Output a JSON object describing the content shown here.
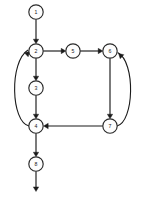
{
  "diagram": {
    "type": "directed-graph",
    "canvas": {
      "width": 145,
      "height": 200,
      "background": "#ffffff"
    },
    "style": {
      "node_fill": "#fdfdfd",
      "node_stroke": "#2a2a2a",
      "edge_color": "#1a1a1a",
      "label_color": "#202020",
      "node_radius": 7.2
    },
    "nodes": [
      {
        "id": "n1",
        "label": "1",
        "cx": 36,
        "cy": 12,
        "r": 7.2
      },
      {
        "id": "n2",
        "label": "2",
        "cx": 36,
        "cy": 51,
        "r": 7.2
      },
      {
        "id": "n3",
        "label": "3",
        "cx": 36,
        "cy": 88,
        "r": 7.2
      },
      {
        "id": "n4",
        "label": "4",
        "cx": 36,
        "cy": 126,
        "r": 7.2
      },
      {
        "id": "n5",
        "label": "5",
        "cx": 73,
        "cy": 51,
        "r": 7.2
      },
      {
        "id": "n6",
        "label": "6",
        "cx": 110,
        "cy": 51,
        "r": 7.2
      },
      {
        "id": "n7",
        "label": "7",
        "cx": 110,
        "cy": 126,
        "r": 7.2
      },
      {
        "id": "n8",
        "label": "8",
        "cx": 36,
        "cy": 164,
        "r": 7.2
      }
    ],
    "edges": [
      {
        "id": "e1",
        "from": "n1",
        "to": "n2",
        "kind": "straight",
        "path": "M 36 19.2 L 36 40.6"
      },
      {
        "id": "e2",
        "from": "n2",
        "to": "n5",
        "kind": "straight",
        "path": "M 43.2 51 L 62.4 51"
      },
      {
        "id": "e3",
        "from": "n5",
        "to": "n6",
        "kind": "straight",
        "path": "M 80.2 51 L 99.4 51"
      },
      {
        "id": "e4",
        "from": "n2",
        "to": "n3",
        "kind": "straight",
        "path": "M 36 58.2 L 36 77.6"
      },
      {
        "id": "e5",
        "from": "n3",
        "to": "n4",
        "kind": "straight",
        "path": "M 36 95.2 L 36 115.6"
      },
      {
        "id": "e6",
        "from": "n6",
        "to": "n7",
        "kind": "straight",
        "path": "M 110 58.2 L 110 115.6"
      },
      {
        "id": "e7",
        "from": "n7",
        "to": "n4",
        "kind": "straight",
        "path": "M 102.8 126 L 47.0 126"
      },
      {
        "id": "e8",
        "from": "n7",
        "to": "n6",
        "kind": "curve-right",
        "path": "M 117.0 126 C 134 122 136 62 117.6 52.6"
      },
      {
        "id": "e9",
        "from": "n4",
        "to": "n2",
        "kind": "curve-left",
        "path": "M 29.0 126 C 11 122 9 62 28.0 50.0"
      },
      {
        "id": "e10",
        "from": "n4",
        "to": "n8",
        "kind": "straight",
        "path": "M 36 133.2 L 36 153.6"
      },
      {
        "id": "e11",
        "from": "n8",
        "to": "exit",
        "kind": "straight",
        "path": "M 36 171.2 L 36 188.0"
      }
    ],
    "arrowheads": [
      {
        "id": "a1",
        "edge": "e1",
        "x": 36,
        "y": 43.8,
        "angle": 90
      },
      {
        "id": "a2",
        "edge": "e2",
        "x": 65.8,
        "y": 51,
        "angle": 0
      },
      {
        "id": "a3",
        "edge": "e3",
        "x": 102.8,
        "y": 51,
        "angle": 0
      },
      {
        "id": "a4",
        "edge": "e4",
        "x": 36,
        "y": 80.8,
        "angle": 90
      },
      {
        "id": "a5",
        "edge": "e5",
        "x": 36,
        "y": 118.8,
        "angle": 90
      },
      {
        "id": "a6",
        "edge": "e6",
        "x": 110,
        "y": 118.8,
        "angle": 90
      },
      {
        "id": "a7",
        "edge": "e7",
        "x": 43.6,
        "y": 126,
        "angle": 180
      },
      {
        "id": "a8",
        "edge": "e8",
        "x": 118.6,
        "y": 53.6,
        "angle": 222
      },
      {
        "id": "a9",
        "edge": "e9",
        "x": 29.6,
        "y": 51.6,
        "angle": 316
      },
      {
        "id": "a10",
        "edge": "e10",
        "x": 36,
        "y": 156.8,
        "angle": 90
      },
      {
        "id": "a11",
        "edge": "e11",
        "x": 36,
        "y": 191.5,
        "angle": 90
      }
    ]
  }
}
